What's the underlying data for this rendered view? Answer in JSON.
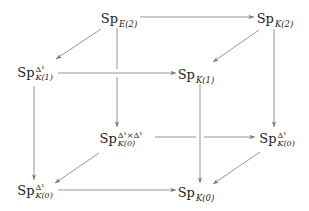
{
  "diagram": {
    "type": "commutative-cube",
    "colors": {
      "arrow": "#7a7a7a",
      "text": "#222222",
      "background": "#ffffff"
    },
    "nodes": {
      "sp_e2": {
        "base": "Sp",
        "sup": "",
        "sub": "E(2)"
      },
      "sp_k2": {
        "base": "Sp",
        "sup": "",
        "sub": "K(2)"
      },
      "sp_k1_d1": {
        "base": "Sp",
        "sup": "Δ¹",
        "sub": "K(1)"
      },
      "sp_k1": {
        "base": "Sp",
        "sup": "",
        "sub": "K(1)"
      },
      "sp_k0_d1d1": {
        "base": "Sp",
        "sup": "Δ¹×Δ¹",
        "sub": "K(0)"
      },
      "sp_k0_d1_r": {
        "base": "Sp",
        "sup": "Δ¹",
        "sub": "K(0)"
      },
      "sp_k0_d1_l": {
        "base": "Sp",
        "sup": "Δ¹",
        "sub": "K(0)"
      },
      "sp_k0": {
        "base": "Sp",
        "sup": "",
        "sub": "K(0)"
      }
    },
    "arrows": [
      {
        "from": "Sp_E(2)",
        "to": "Sp_K(2)"
      },
      {
        "from": "Sp_E(2)",
        "to": "Sp^Δ¹_K(1)"
      },
      {
        "from": "Sp_E(2)",
        "to": "Sp^Δ¹×Δ¹_K(0)"
      },
      {
        "from": "Sp_K(2)",
        "to": "Sp_K(1)"
      },
      {
        "from": "Sp_K(2)",
        "to": "Sp^Δ¹_K(0) (right)"
      },
      {
        "from": "Sp^Δ¹_K(1)",
        "to": "Sp_K(1)"
      },
      {
        "from": "Sp^Δ¹_K(1)",
        "to": "Sp^Δ¹_K(0) (left)"
      },
      {
        "from": "Sp_K(1)",
        "to": "Sp_K(0)"
      },
      {
        "from": "Sp^Δ¹×Δ¹_K(0)",
        "to": "Sp^Δ¹_K(0) (right)"
      },
      {
        "from": "Sp^Δ¹×Δ¹_K(0)",
        "to": "Sp^Δ¹_K(0) (left)"
      },
      {
        "from": "Sp^Δ¹_K(0) (right)",
        "to": "Sp_K(0)"
      },
      {
        "from": "Sp^Δ¹_K(0) (left)",
        "to": "Sp_K(0)"
      }
    ]
  }
}
